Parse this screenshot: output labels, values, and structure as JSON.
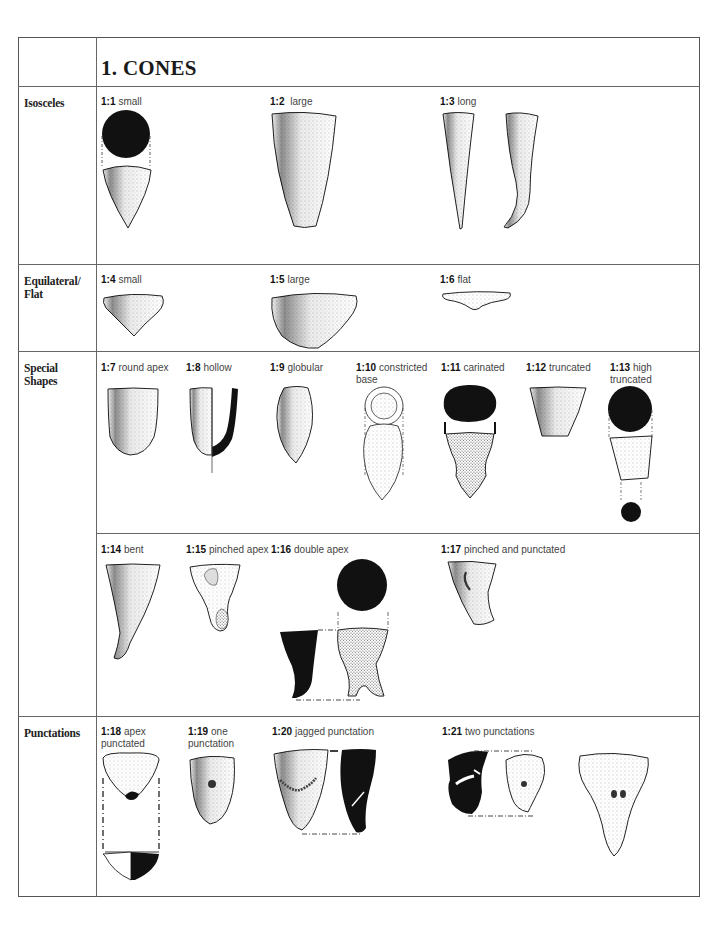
{
  "header": {
    "title": "1. CONES"
  },
  "categories": [
    {
      "id": "isosceles",
      "label": "Isosceles"
    },
    {
      "id": "equilateral",
      "label": "Equilateral/ Flat"
    },
    {
      "id": "special",
      "label": "Special Shapes"
    },
    {
      "id": "punctations",
      "label": "Punctations"
    }
  ],
  "types": [
    {
      "code": "1:1",
      "name": "small",
      "category": "Isosceles"
    },
    {
      "code": "1:2",
      "name": "large",
      "category": "Isosceles"
    },
    {
      "code": "1:3",
      "name": "long",
      "category": "Isosceles"
    },
    {
      "code": "1:4",
      "name": "small",
      "category": "Equilateral/ Flat"
    },
    {
      "code": "1:5",
      "name": "large",
      "category": "Equilateral/ Flat"
    },
    {
      "code": "1:6",
      "name": "flat",
      "category": "Equilateral/ Flat"
    },
    {
      "code": "1:7",
      "name": "round apex",
      "category": "Special Shapes"
    },
    {
      "code": "1:8",
      "name": "hollow",
      "category": "Special Shapes"
    },
    {
      "code": "1:9",
      "name": "globular",
      "category": "Special Shapes"
    },
    {
      "code": "1:10",
      "name": "constricted base",
      "category": "Special Shapes"
    },
    {
      "code": "1:11",
      "name": "carinated",
      "category": "Special Shapes"
    },
    {
      "code": "1:12",
      "name": "truncated",
      "category": "Special Shapes"
    },
    {
      "code": "1:13",
      "name": "high truncated",
      "category": "Special Shapes"
    },
    {
      "code": "1:14",
      "name": "bent",
      "category": "Special Shapes"
    },
    {
      "code": "1:15",
      "name": "pinched apex",
      "category": "Special Shapes"
    },
    {
      "code": "1:16",
      "name": "double apex",
      "category": "Special Shapes"
    },
    {
      "code": "1:17",
      "name": "pinched and punctated",
      "category": "Special Shapes"
    },
    {
      "code": "1:18",
      "name": "apex punctated",
      "category": "Punctations"
    },
    {
      "code": "1:19",
      "name": "one punctation",
      "category": "Punctations"
    },
    {
      "code": "1:20",
      "name": "jagged punctation",
      "category": "Punctations"
    },
    {
      "code": "1:21",
      "name": "two punctations",
      "category": "Punctations"
    }
  ],
  "labels": {
    "t10_line1": "constricted",
    "t10_line2": "base",
    "t13_line1": "high",
    "t13_line2": "truncated",
    "t18_line1": "apex",
    "t18_line2": "punctated",
    "t19_line1": "one",
    "t19_line2": "punctation"
  },
  "colors": {
    "ink": "#111111",
    "rule": "#666666",
    "label": "#444444"
  }
}
